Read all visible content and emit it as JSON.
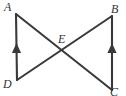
{
  "figure": {
    "type": "geometry-diagram",
    "background_color": "#ffffff",
    "stroke_color": "#3a3a3a",
    "label_color": "#333333",
    "labels": {
      "a": "A",
      "b": "B",
      "c": "C",
      "d": "D",
      "e": "E"
    },
    "points": {
      "A": {
        "x": 16,
        "y": 14
      },
      "B": {
        "x": 112,
        "y": 16
      },
      "C": {
        "x": 112,
        "y": 90
      },
      "D": {
        "x": 17,
        "y": 80
      },
      "E": {
        "x": 64,
        "y": 51
      }
    },
    "segments": [
      {
        "name": "segment-AD",
        "from": "A",
        "to": "D",
        "arrow_marks": 1
      },
      {
        "name": "segment-BC",
        "from": "B",
        "to": "C",
        "arrow_marks": 1
      },
      {
        "name": "segment-AC",
        "from": "A",
        "to": "C",
        "arrow_marks": 0
      },
      {
        "name": "segment-DB",
        "from": "D",
        "to": "B",
        "arrow_marks": 0
      }
    ],
    "intersection": {
      "name": "E",
      "of": [
        "segment-AC",
        "segment-DB"
      ]
    }
  }
}
